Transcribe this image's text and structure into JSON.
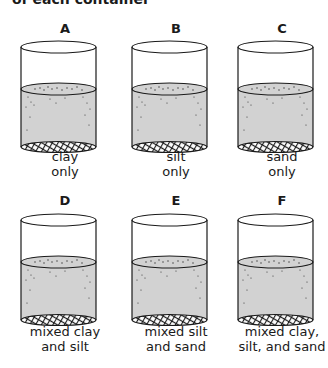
{
  "caption": "of each container",
  "containers": [
    {
      "label": "A",
      "line1": "clay",
      "line2": "only"
    },
    {
      "label": "B",
      "line1": "silt",
      "line2": "only"
    },
    {
      "label": "C",
      "line1": "sand",
      "line2": "only"
    },
    {
      "label": "D",
      "line1": "mixed clay",
      "line2": "and silt"
    },
    {
      "label": "E",
      "line1": "mixed silt",
      "line2": "and sand"
    },
    {
      "label": "F",
      "line1": "mixed clay,",
      "line2": "silt, and sand"
    }
  ],
  "colors": {
    "water": "#d2d2d2",
    "outline": "#1a1a1a",
    "background": "#ffffff"
  }
}
